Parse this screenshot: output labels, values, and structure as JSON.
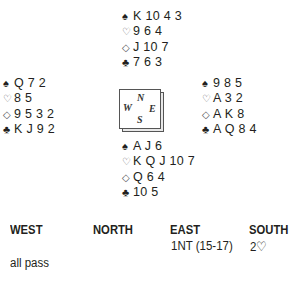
{
  "hands": {
    "north": {
      "spades": "K 10 4 3",
      "hearts": "9 6 4",
      "diamonds": "J 10 7",
      "clubs": "7 6 3"
    },
    "west": {
      "spades": "Q 7 2",
      "hearts": "8 5",
      "diamonds": "9 5 3 2",
      "clubs": "K J 9 2"
    },
    "east": {
      "spades": "9 8 5",
      "hearts": "A 3 2",
      "diamonds": "A K 8",
      "clubs": "A Q 8 4"
    },
    "south": {
      "spades": "A J 6",
      "hearts": "K Q J 10 7",
      "diamonds": "Q 6 4",
      "clubs": "10 5"
    }
  },
  "suit_symbols": {
    "spades": "♠",
    "hearts": "♡",
    "diamonds": "◇",
    "clubs": "♣"
  },
  "compass": {
    "north": "N",
    "west": "W",
    "east": "E",
    "south": "S"
  },
  "auction": {
    "headers": [
      "WEST",
      "NORTH",
      "EAST",
      "SOUTH"
    ],
    "rounds": [
      {
        "east": "1NT (15-17)",
        "south": "2♡"
      },
      {
        "west": "all pass"
      }
    ]
  }
}
